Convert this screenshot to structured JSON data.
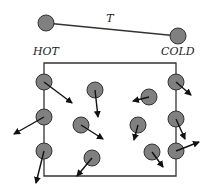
{
  "colors": {
    "ball_fill": "#808080",
    "ball_stroke": "#333333",
    "line": "#333333",
    "arrow": "#111111",
    "background": "#ffffff"
  },
  "rod": {
    "label": "T",
    "label_pos": [
      110,
      22
    ],
    "left_ball": [
      46,
      23
    ],
    "right_ball": [
      178,
      36
    ],
    "radius": 8
  },
  "labels": {
    "hot": "HOT",
    "hot_pos": [
      33,
      55
    ],
    "cold": "COLD",
    "cold_pos": [
      161,
      55
    ]
  },
  "box": {
    "x1": 44,
    "y1": 63,
    "x2": 176,
    "y2": 176
  },
  "particles": [
    {
      "name": "wall-hot-1",
      "cx": 44,
      "cy": 82,
      "ax": 72,
      "ay": 103
    },
    {
      "name": "wall-hot-2",
      "cx": 44,
      "cy": 117,
      "ax": 14,
      "ay": 134
    },
    {
      "name": "wall-hot-3",
      "cx": 44,
      "cy": 151,
      "ax": 36,
      "ay": 183
    },
    {
      "name": "gas-1",
      "cx": 95,
      "cy": 90,
      "ax": 98,
      "ay": 117
    },
    {
      "name": "gas-2",
      "cx": 81,
      "cy": 125,
      "ax": 103,
      "ay": 139
    },
    {
      "name": "gas-3",
      "cx": 92,
      "cy": 158,
      "ax": 77,
      "ay": 176
    },
    {
      "name": "gas-4",
      "cx": 149,
      "cy": 97,
      "ax": 133,
      "ay": 101
    },
    {
      "name": "gas-5",
      "cx": 138,
      "cy": 125,
      "ax": 134,
      "ay": 140
    },
    {
      "name": "gas-6",
      "cx": 152,
      "cy": 152,
      "ax": 163,
      "ay": 167
    },
    {
      "name": "wall-cold-1",
      "cx": 176,
      "cy": 82,
      "ax": 191,
      "ay": 95
    },
    {
      "name": "wall-cold-2",
      "cx": 176,
      "cy": 119,
      "ax": 185,
      "ay": 139
    },
    {
      "name": "wall-cold-3",
      "cx": 176,
      "cy": 151,
      "ax": 199,
      "ay": 142
    }
  ],
  "particle_radius": 8
}
